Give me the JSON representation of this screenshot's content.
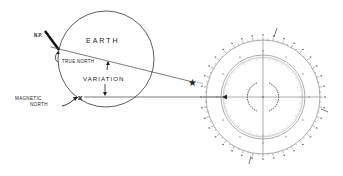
{
  "diagram": {
    "labels": {
      "earth": "EARTH",
      "north_pole": "N.P.",
      "true_north": "TRUE NORTH",
      "variation": "VARIATION",
      "magnetic_north_line1": "MAGNETIC",
      "magnetic_north_line2": "NORTH"
    },
    "symbols": {
      "magnetic_north_marker": "x",
      "celestial_marker": "★",
      "compass_arrow": "◄"
    },
    "colors": {
      "ink": "#222222",
      "faint_ink": "#888888",
      "background": "#ffffff"
    }
  }
}
